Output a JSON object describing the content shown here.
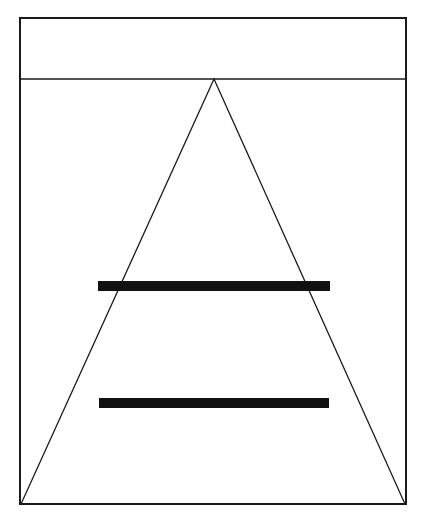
{
  "canvas": {
    "width": 425,
    "height": 521,
    "background": "#ffffff"
  },
  "colors": {
    "stroke": "#1a1a1a",
    "bar": "#111111"
  },
  "frame": {
    "outer": {
      "x1": 20,
      "y1": 18,
      "x2": 406,
      "y2": 504,
      "stroke_width": 2
    },
    "header_divider": {
      "x1": 20,
      "y1": 79,
      "x2": 406,
      "y2": 79,
      "stroke_width": 1.6
    }
  },
  "triangle": {
    "apex": [
      214,
      79
    ],
    "base_left": [
      21,
      504
    ],
    "base_right": [
      405,
      504
    ],
    "stroke_width": 1.3
  },
  "bars": [
    {
      "name": "upper-bar",
      "x": 98,
      "y": 281,
      "width": 232,
      "height": 10
    },
    {
      "name": "lower-bar",
      "x": 99,
      "y": 398,
      "width": 230,
      "height": 10
    }
  ]
}
